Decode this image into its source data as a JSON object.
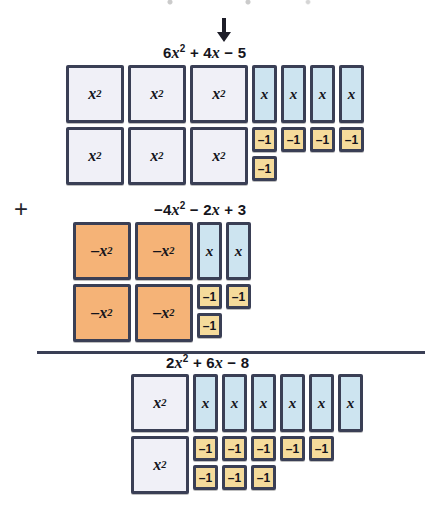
{
  "page": {
    "operator": "+",
    "colors": {
      "x_squared_tile": "#f0f0f7",
      "negative_x_squared_tile": "#f5b377",
      "x_tile": "#cde4f0",
      "negative_one_tile": "#f5db9b",
      "tile_border": "#3a3f55",
      "text": "#15151c"
    }
  },
  "arrow": {
    "name": "down-arrow",
    "points_to": "6x^2 + 4x - 5"
  },
  "groups": [
    {
      "id": "addend-1",
      "role": "addend",
      "expression": {
        "plain": "6x^2 + 4x - 5",
        "parts": [
          {
            "coef": "6",
            "var": "x",
            "exp": "2"
          },
          {
            "op": "+",
            "coef": "4",
            "var": "x",
            "exp": ""
          },
          {
            "op": "−",
            "coef": "5",
            "var": "",
            "exp": ""
          }
        ]
      },
      "counts": {
        "x_squared": 6,
        "neg_x_squared": 0,
        "x": 4,
        "neg_one": 5
      },
      "tiles": [
        {
          "kind": "x_squared",
          "label": "x",
          "sup": "2",
          "row": 1,
          "col": 1
        },
        {
          "kind": "x_squared",
          "label": "x",
          "sup": "2",
          "row": 1,
          "col": 2
        },
        {
          "kind": "x_squared",
          "label": "x",
          "sup": "2",
          "row": 1,
          "col": 3
        },
        {
          "kind": "x_squared",
          "label": "x",
          "sup": "2",
          "row": 2,
          "col": 1
        },
        {
          "kind": "x_squared",
          "label": "x",
          "sup": "2",
          "row": 2,
          "col": 2
        },
        {
          "kind": "x_squared",
          "label": "x",
          "sup": "2",
          "row": 2,
          "col": 3
        },
        {
          "kind": "x",
          "label": "x",
          "sup": "",
          "row": 1,
          "col": 4
        },
        {
          "kind": "x",
          "label": "x",
          "sup": "",
          "row": 1,
          "col": 5
        },
        {
          "kind": "x",
          "label": "x",
          "sup": "",
          "row": 1,
          "col": 6
        },
        {
          "kind": "x",
          "label": "x",
          "sup": "",
          "row": 1,
          "col": 7
        },
        {
          "kind": "neg_one",
          "label": "–1",
          "sup": "",
          "row": 2,
          "col": 4
        },
        {
          "kind": "neg_one",
          "label": "–1",
          "sup": "",
          "row": 2,
          "col": 5
        },
        {
          "kind": "neg_one",
          "label": "–1",
          "sup": "",
          "row": 2,
          "col": 6
        },
        {
          "kind": "neg_one",
          "label": "–1",
          "sup": "",
          "row": 2,
          "col": 7
        },
        {
          "kind": "neg_one",
          "label": "–1",
          "sup": "",
          "row": 3,
          "col": 4
        }
      ]
    },
    {
      "id": "addend-2",
      "role": "addend",
      "expression": {
        "plain": "-4x^2 - 2x + 3",
        "parts": [
          {
            "op": "−",
            "coef": "4",
            "var": "x",
            "exp": "2"
          },
          {
            "op": "−",
            "coef": "2",
            "var": "x",
            "exp": ""
          },
          {
            "op": "+",
            "coef": "3",
            "var": "",
            "exp": ""
          }
        ]
      },
      "counts": {
        "x_squared": 0,
        "neg_x_squared": 4,
        "x": 2,
        "neg_one": 3
      },
      "tiles": [
        {
          "kind": "neg_x_squared",
          "label": "–x",
          "sup": "2",
          "row": 1,
          "col": 1
        },
        {
          "kind": "neg_x_squared",
          "label": "–x",
          "sup": "2",
          "row": 1,
          "col": 2
        },
        {
          "kind": "neg_x_squared",
          "label": "–x",
          "sup": "2",
          "row": 2,
          "col": 1
        },
        {
          "kind": "neg_x_squared",
          "label": "–x",
          "sup": "2",
          "row": 2,
          "col": 2
        },
        {
          "kind": "x",
          "label": "x",
          "sup": "",
          "row": 1,
          "col": 3
        },
        {
          "kind": "x",
          "label": "x",
          "sup": "",
          "row": 1,
          "col": 4
        },
        {
          "kind": "neg_one",
          "label": "–1",
          "sup": "",
          "row": 2,
          "col": 3
        },
        {
          "kind": "neg_one",
          "label": "–1",
          "sup": "",
          "row": 2,
          "col": 4
        },
        {
          "kind": "neg_one",
          "label": "–1",
          "sup": "",
          "row": 3,
          "col": 3
        }
      ]
    },
    {
      "id": "sum",
      "role": "sum",
      "expression": {
        "plain": "2x^2 + 6x - 8",
        "parts": [
          {
            "coef": "2",
            "var": "x",
            "exp": "2"
          },
          {
            "op": "+",
            "coef": "6",
            "var": "x",
            "exp": ""
          },
          {
            "op": "−",
            "coef": "8",
            "var": "",
            "exp": ""
          }
        ]
      },
      "counts": {
        "x_squared": 2,
        "neg_x_squared": 0,
        "x": 6,
        "neg_one": 8
      },
      "tiles": [
        {
          "kind": "x_squared",
          "label": "x",
          "sup": "2",
          "row": 1,
          "col": 1
        },
        {
          "kind": "x_squared",
          "label": "x",
          "sup": "2",
          "row": 2,
          "col": 1
        },
        {
          "kind": "x",
          "label": "x",
          "sup": "",
          "row": 1,
          "col": 2
        },
        {
          "kind": "x",
          "label": "x",
          "sup": "",
          "row": 1,
          "col": 3
        },
        {
          "kind": "x",
          "label": "x",
          "sup": "",
          "row": 1,
          "col": 4
        },
        {
          "kind": "x",
          "label": "x",
          "sup": "",
          "row": 1,
          "col": 5
        },
        {
          "kind": "x",
          "label": "x",
          "sup": "",
          "row": 1,
          "col": 6
        },
        {
          "kind": "x",
          "label": "x",
          "sup": "",
          "row": 1,
          "col": 7
        },
        {
          "kind": "neg_one",
          "label": "–1",
          "sup": "",
          "row": 2,
          "col": 2
        },
        {
          "kind": "neg_one",
          "label": "–1",
          "sup": "",
          "row": 2,
          "col": 3
        },
        {
          "kind": "neg_one",
          "label": "–1",
          "sup": "",
          "row": 2,
          "col": 4
        },
        {
          "kind": "neg_one",
          "label": "–1",
          "sup": "",
          "row": 2,
          "col": 5
        },
        {
          "kind": "neg_one",
          "label": "–1",
          "sup": "",
          "row": 2,
          "col": 6
        },
        {
          "kind": "neg_one",
          "label": "–1",
          "sup": "",
          "row": 3,
          "col": 2
        },
        {
          "kind": "neg_one",
          "label": "–1",
          "sup": "",
          "row": 3,
          "col": 3
        },
        {
          "kind": "neg_one",
          "label": "–1",
          "sup": "",
          "row": 3,
          "col": 4
        }
      ]
    }
  ],
  "layout": {
    "group_origins": [
      {
        "id": "addend-1",
        "x": 66,
        "y": 65,
        "label_x": 205,
        "label_y": 44
      },
      {
        "id": "addend-2",
        "x": 73,
        "y": 222,
        "label_x": 200,
        "label_y": 201
      },
      {
        "id": "sum",
        "x": 131,
        "y": 374,
        "label_x": 208,
        "label_y": 354
      }
    ]
  }
}
